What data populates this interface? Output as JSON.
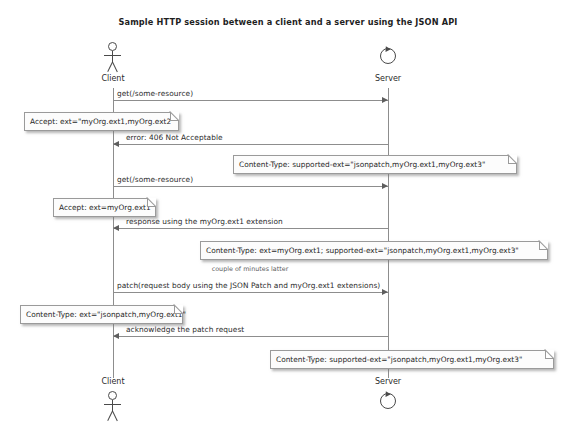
{
  "diagram": {
    "title": "Sample HTTP session between a client and a server using the JSON API",
    "type": "uml-sequence-diagram",
    "colors": {
      "line": "#8d8d8d",
      "text": "#2b2b2b",
      "note_border": "#9a9a9a",
      "note_fill": "#fcfcfc",
      "figure": "#4a4a4a"
    }
  },
  "participants": [
    {
      "id": "client",
      "label": "Client",
      "icon": "actor-stick-figure",
      "x": 113
    },
    {
      "id": "server",
      "label": "Server",
      "icon": "control-circle",
      "x": 388
    }
  ],
  "messages": [
    {
      "id": "m1",
      "label": "get(/some-resource)",
      "from": "client",
      "to": "server",
      "direction": "right",
      "y": 100
    },
    {
      "id": "m2",
      "label": "error: 406 Not Acceptable",
      "from": "server",
      "to": "client",
      "direction": "left",
      "y": 144
    },
    {
      "id": "m3",
      "label": "get(/some-resource)",
      "from": "client",
      "to": "server",
      "direction": "right",
      "y": 186
    },
    {
      "id": "m4",
      "label": "response using the myOrg.ext1 extension",
      "from": "server",
      "to": "client",
      "direction": "left",
      "y": 228
    },
    {
      "id": "m5",
      "label": "patch(request body using the JSON Patch and myOrg.ext1 extensions)",
      "from": "client",
      "to": "server",
      "direction": "right",
      "y": 292
    },
    {
      "id": "m6",
      "label": "acknowledge the patch request",
      "from": "server",
      "to": "client",
      "direction": "left",
      "y": 336
    }
  ],
  "time_markers": [
    {
      "id": "t1",
      "label": "couple of minutes latter",
      "x": 250,
      "y": 268
    }
  ],
  "notes": [
    {
      "id": "n1",
      "text": "Accept: ext=\"myOrg.ext1,myOrg.ext2\"",
      "attached_to": "m1",
      "side": "left",
      "x": 24,
      "y": 112,
      "width": 155
    },
    {
      "id": "n2",
      "text": "Content-Type: supported-ext=\"jsonpatch,myOrg.ext1,myOrg.ext3\"",
      "attached_to": "m2",
      "side": "right",
      "x": 233,
      "y": 155,
      "width": 284
    },
    {
      "id": "n3",
      "text": "Accept: ext=myOrg.ext1",
      "attached_to": "m3",
      "side": "left",
      "x": 53,
      "y": 198,
      "width": 103
    },
    {
      "id": "n4",
      "text": "Content-Type: ext=myOrg.ext1; supported-ext=\"jsonpatch,myOrg.ext1,myOrg.ext3\"",
      "attached_to": "m4",
      "side": "right",
      "x": 200,
      "y": 241,
      "width": 348
    },
    {
      "id": "n5",
      "text": "Content-Type: ext=\"jsonpatch,myOrg.ext1\"",
      "attached_to": "m5",
      "side": "left",
      "x": 20,
      "y": 305,
      "width": 163
    },
    {
      "id": "n6",
      "text": "Content-Type: supported-ext=\"jsonpatch,myOrg.ext1,myOrg.ext3\"",
      "attached_to": "m6",
      "side": "right",
      "x": 270,
      "y": 350,
      "width": 284
    }
  ],
  "lifelines": {
    "top": 88,
    "bottom": 378
  }
}
